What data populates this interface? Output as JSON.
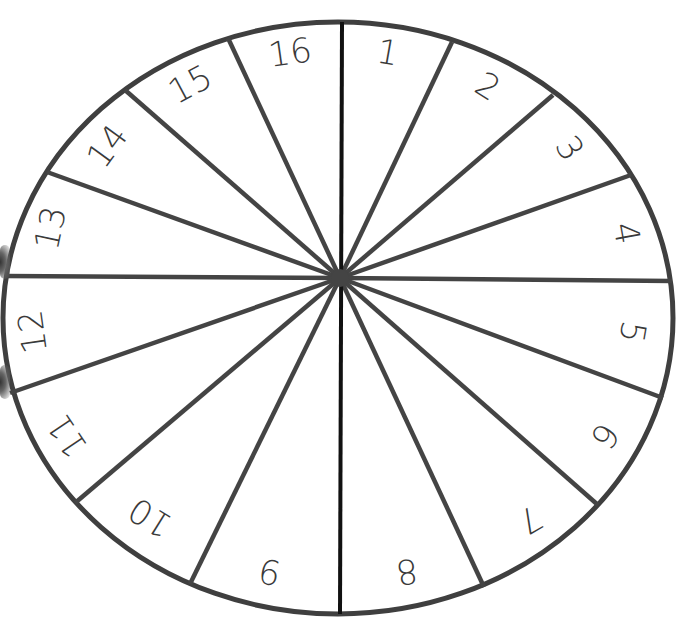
{
  "diagram": {
    "type": "number-spinner-wheel",
    "segment_count": 16,
    "colors": {
      "outline": "#3f3f3f",
      "spokes": "#444444",
      "vertical_axis": "#111111",
      "label": "#3a3a3a",
      "background": "#ffffff"
    },
    "hub": {
      "x": 340,
      "y": 278
    },
    "outer_ellipse": {
      "cx": 338,
      "cy": 318,
      "rx": 335,
      "ry": 296
    },
    "spoke_endpoints": [
      {
        "x": 342,
        "y": 22
      },
      {
        "x": 452,
        "y": 42
      },
      {
        "x": 553,
        "y": 95
      },
      {
        "x": 631,
        "y": 175
      },
      {
        "x": 672,
        "y": 281
      },
      {
        "x": 663,
        "y": 398
      },
      {
        "x": 598,
        "y": 505
      },
      {
        "x": 484,
        "y": 587
      },
      {
        "x": 340,
        "y": 614
      },
      {
        "x": 190,
        "y": 584
      },
      {
        "x": 75,
        "y": 503
      },
      {
        "x": 10,
        "y": 393
      },
      {
        "x": 5,
        "y": 276
      },
      {
        "x": 47,
        "y": 172
      },
      {
        "x": 125,
        "y": 90
      },
      {
        "x": 228,
        "y": 38
      }
    ],
    "segments": [
      {
        "label": "1",
        "x": 388,
        "y": 52,
        "rotate": 10
      },
      {
        "label": "2",
        "x": 488,
        "y": 86,
        "rotate": 32
      },
      {
        "label": "3",
        "x": 570,
        "y": 148,
        "rotate": 58
      },
      {
        "label": "4",
        "x": 627,
        "y": 233,
        "rotate": 80
      },
      {
        "label": "5",
        "x": 633,
        "y": 332,
        "rotate": 100
      },
      {
        "label": "6",
        "x": 605,
        "y": 436,
        "rotate": 125
      },
      {
        "label": "7",
        "x": 530,
        "y": 520,
        "rotate": 150
      },
      {
        "label": "8",
        "x": 407,
        "y": 572,
        "rotate": 172
      },
      {
        "label": "9",
        "x": 270,
        "y": 572,
        "rotate": 192
      },
      {
        "label": "10",
        "x": 150,
        "y": 518,
        "rotate": 212
      },
      {
        "label": "11",
        "x": 67,
        "y": 436,
        "rotate": 236
      },
      {
        "label": "12",
        "x": 32,
        "y": 332,
        "rotate": 262
      },
      {
        "label": "13",
        "x": 50,
        "y": 228,
        "rotate": 282
      },
      {
        "label": "14",
        "x": 107,
        "y": 146,
        "rotate": 306
      },
      {
        "label": "15",
        "x": 190,
        "y": 84,
        "rotate": 332
      },
      {
        "label": "16",
        "x": 290,
        "y": 52,
        "rotate": 352
      }
    ]
  }
}
